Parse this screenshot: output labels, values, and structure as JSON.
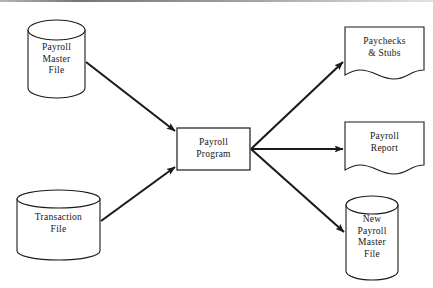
{
  "diagram": {
    "type": "system-flowchart",
    "stroke_color": "#1a1a1a",
    "fill_color": "#ffffff",
    "text_color": "#161616",
    "nodes": [
      {
        "id": "payroll-master-file",
        "shape": "cylinder",
        "role": "input",
        "label": "Payroll\nMaster\nFile",
        "x": 28,
        "y": 20,
        "width": 57,
        "height": 78
      },
      {
        "id": "transaction-file",
        "shape": "cylinder",
        "role": "input",
        "label": "Transaction\nFile",
        "x": 17,
        "y": 190,
        "width": 83,
        "height": 70
      },
      {
        "id": "payroll-program",
        "shape": "process",
        "role": "process",
        "label": "Payroll\nProgram",
        "x": 177,
        "y": 128,
        "width": 73,
        "height": 42
      },
      {
        "id": "paychecks-stubs",
        "shape": "document",
        "role": "output",
        "label": "Paychecks\n& Stubs",
        "x": 345,
        "y": 27,
        "width": 79,
        "height": 50
      },
      {
        "id": "payroll-report",
        "shape": "document",
        "role": "output",
        "label": "Payroll\nReport",
        "x": 345,
        "y": 122,
        "width": 79,
        "height": 50
      },
      {
        "id": "new-payroll-master-file",
        "shape": "cylinder",
        "role": "output",
        "label": "New\nPayroll\nMaster\nFile",
        "x": 346,
        "y": 196,
        "width": 52,
        "height": 84
      }
    ],
    "connectors": [
      {
        "id": "master-file-to-program",
        "from": "payroll-master-file",
        "to": "payroll-program",
        "arrow": "to"
      },
      {
        "id": "transaction-file-to-program",
        "from": "transaction-file",
        "to": "payroll-program",
        "arrow": "to"
      },
      {
        "id": "program-to-paychecks",
        "from": "payroll-program",
        "to": "paychecks-stubs",
        "arrow": "to"
      },
      {
        "id": "program-to-report",
        "from": "payroll-program",
        "to": "payroll-report",
        "arrow": "to"
      },
      {
        "id": "program-to-new-master",
        "from": "payroll-program",
        "to": "new-payroll-master-file",
        "arrow": "to"
      }
    ]
  }
}
